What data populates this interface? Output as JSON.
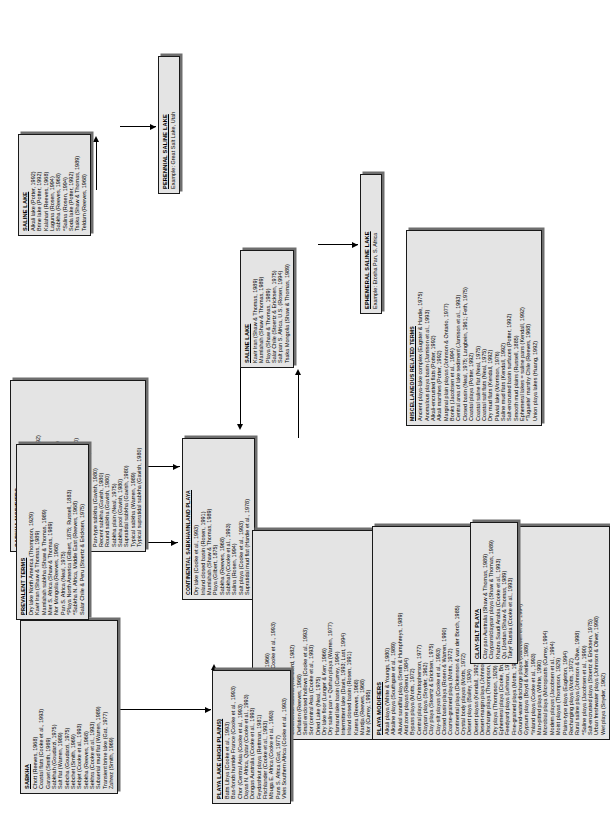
{
  "figure": {
    "type": "hierarchical classification flowchart",
    "orientation": "rotated 90 degrees (landscape figure on portrait page)"
  },
  "boxes": {
    "sabkha": {
      "title": "SABKHA",
      "items": [
        "Chott (Reeves, 1968)",
        "Coastal flats (Cooke et al., 1993)",
        "Garaet (Smith, 1969)",
        "Sabkhah (Goudarzi, 1975)",
        "Salt flat (Warren, 1989)",
        "Sebcha (Goudarzi, 1975)",
        "Sebchet (Smith, 1969)",
        "Sebjet (Cooke et al., 1993)",
        "Sebkha (Reeves, 1968)",
        "Sekhra (Cooke et al., 1993)",
        "Subaerial mud flat (Warren, 1989)",
        "Transient brine lake (Gat, 1977)",
        "Zahrez (Smith, 1969)"
      ]
    },
    "sabkha_modifiers": {
      "title": "SABKHA MODIFIERS",
      "items": [
        "Ancient sabkha (Warren, 1989)",
        "Coastal sabkha (Warren, 1989)",
        "Coastal siliciclastic sabkha (Andersson, 1992)",
        "Continental sabkha (Handford, 1982)",
        "Fossil sabkha (Wood & Wolfe, 1969)",
        "Inland sabkha (Glennie, 1970; Davis, 1993)",
        "Interdune sabkha (Warren, 1989)",
        "Internal sabkha (Cooke et al., 1982)",
        "Lagoon beach sabkha (Levy & Yizhak, 1980)",
        "Marine coastal sabkha (Warren, 1989)",
        "Modern marine sabkha (Warren, 1989)",
        "Pan-type sabkha (Gavish, 1980)",
        "Recent sabkha (Gavish, 1980)",
        "Round sabkha (Gavish, 1980)",
        "Sabkha plain (Neal, 1975)",
        "Sabkha pool (Gavish, 1980)",
        "Supratidal sabkha (Gavish, 1980)",
        "Typical sabkha (Warren, 1989)",
        "Typical supratidal sabkha (Gavish, 1980)"
      ]
    },
    "prevalent_terms": {
      "title": "PREVALENT TERMS",
      "items": [
        "Dry lake North America (Thompson, 1929)",
        "Kavir Iran (Shaw & Thomas, 1989)",
        "Mamlahah sabkha (Shaw & Thomas, 1989)",
        "Mier S. Africa (Shaw & Thomas, 1989)",
        "Nor Mongolia (Reeves, 1968)",
        "Pan S. Africa (Neal, 1975)",
        "*Playa North America (Gilbert, 1875; Russell, 1883)",
        "*Sabkha N. Africa, Middle East (Reeves, 1968)",
        "Salar Chile & Peru (Stoertz & Ericksen, 1975)"
      ]
    },
    "continental_sabkha": {
      "title": "CONTINENTAL SABKHA/INLAND PLAYA",
      "items": [
        "Dry lake (Cooke et al., 1993)",
        "Inland closed basin (Rosen, 1991)",
        "Mamlahah (Shaw & Thomas, 1989)",
        "Playa (Gilbert, 1875)",
        "Sabkha (Reeves, 1968)",
        "Sabkhah (Cooke et al., 1993)",
        "Salina (Rosen, 1994)",
        "Salt playa (Cooke et al., 1993)",
        "Supratidal mud flat (Hardie et al., 1978)"
      ]
    },
    "playa": {
      "title": "PLAYA",
      "items": [
        "Alkali lake (Ponads & Behr, 1966)",
        "Bas-fonds humide France (Cooke et al., 1993)",
        "Chott (Cooke et al., 1993)",
        "Clay flat (Thompson, 1929)",
        "Continental sabkha (Handford, 1982)",
        "Deflation (Reeves, 1968)",
        "Small enclosed hollows (Cooke et al., 1993)",
        "Sor (central Asia (Cooke et al., 1993)",
        "Dried Lake (Neal, 1975)",
        "Dry lake floor (Langer & Kerr, 1966)",
        "Dry saline pan = Qarhan playa (Warren, 1977)",
        "Hamand lake basin (Currey, 1994)",
        "Intermittent lake (Davis, 1993; Last, 1994)",
        "Inland closed basin (Rosen, 1991)",
        "Karera (Reeves, 1968)",
        "Mardja (Reeves, 1968)",
        "Nor (Currey, 1995)",
        "Pan (Reeves, 1968)",
        "Playa (Reeves, 1968)",
        "Playa flat (Motts, 1972)",
        "Playa (Reeves, 1968)",
        "Playa (Reeves, 1968)",
        "Saline mud flat (Reeves, 1968)",
        "Sabkha salt lake or playa (Rosen, 1994)",
        "Saline (Rosen, 1994)",
        "Salina (Rosen, 1994)",
        "Salt flat sabkha (Hussain, 1991)",
        "Salt pan (Kendall, 1992)",
        "Schalu (Reeves, 1968)",
        "Sebchet (Reeves, 1968)",
        "Sebka (Reeves, 1968)",
        "Sebkha (Reeves, 1968)",
        "Shallow lake (Last, 1994)",
        "Shott (Reeves, 1968)",
        "Rei (Reeves, 1968)",
        "Takyra = dry lake (Reeves, 1968)",
        "Tyr (Reeves, 1968)"
      ]
    },
    "playa_modifiers": {
      "title": "PLAYA MODIFIERS",
      "items": [
        "Alkali playa (White & Youngs, 1980)",
        "Alkaline playa (Southgate et al., 1989)",
        "Alluvial sandflat playa (Smith & Humphreys, 1989)",
        "Arid zone playas (Rienut, 1984)",
        "Bypass playa (Motts, 1972)",
        "Central playa (Christopherson, 1977)",
        "Claypan playa (Snyder, 1962)",
        "Clay playa (Stoertz & Ericksen, 1975)",
        "Clay-silt playas (Cooke et al., 1993)",
        "Closed basin playa (Rosen & Warren, 1990)",
        "Coarse-grained playa (Motts, 1972)",
        "Continental playa (Dickenson & van der Borch, 1985)",
        "Crystal body playas (Motts, 1972)",
        "Desert playa (Bailey, 1934)",
        "Desert playas (Kendall, 1992)",
        "Desert-margin playa (Johnson, 1977)",
        "Discharge playa (Thompson, 1929)",
        "Dry playa (Thompson, 1929)",
        "Ephemeral playa (Cooke, Brunsden & Last, 1989)",
        "Feedyard playa (Lehman, 1972)",
        "Fine-grained playa (Motts, 1972)",
        "Ground-water discharge playa (Jacobsen et al., 1994)",
        "Gypsum playa (Boyd & Kreitler, 1989)",
        "*Inland playa (Cooke et al., 1993)",
        "Man-pitted playa (White, 1990)",
        "Microbial playa (Micropiasts (Currey, 1994)",
        "Modern playas (Jacobsen et al., 1994)",
        "Moist playas (Thompson, 1929)",
        "Plains-type playa (Eagleton, 1994)",
        "Recharging playa (Motts, 1972)",
        "Rural saline playa (Johnson & Olive, 1998)",
        "*Saline playa (Jacobsen et al., 1990)",
        "Salt-encrusted playa (Stoertz & Ericksen, 1975)",
        "Urban freshwater playa (Johnson & Oliver, 1998)",
        "Wet playa (Snyder, 1962)"
      ]
    },
    "playa_lake": {
      "title": "PLAYA LAKE (HIGH PLAINS)",
      "items": [
        "Batts Libya (Cooke et al., 1993)",
        "Bas-fonds humide France (Cooke et al., 1993)",
        "Chor (Central Asia (Cooke et al., 1993)",
        "Dayas N. Africa, Qatar (Cooke et al., 1993)",
        "Dongas Australia (Cooke et al., 1993)",
        "Feydashkut playa (Rettman, 1981)",
        "Fischlander (Cooke et al., 1993)",
        "Mbuga E. Africa (Cooke et al., 1993)",
        "Pans S. Africa (Gat, 1977)",
        "Vleis Southern Africa (Cooke et al., 1993)"
      ]
    },
    "clay_silt_playa": {
      "title": "CLAY-SILT PLAYA",
      "items": [
        "Clay pan Australia (Shaw & Thomas, 1989)",
        "Claypans/claypan playa (Shaw & Thomas, 1989)",
        "Khabra Saudi Arabia (Cooke et al., 1993)",
        "Qa (Jordan (Shaw & Thomas, 1989)",
        "Takyr Russia (Cooke et al., 1993)"
      ]
    },
    "miscellaneous": {
      "title": "MISCELLANEOUS RELATED TERMS",
      "items": [
        "Ancient playa-lake complex (Eugster & Hardie, 1975)",
        "Anomalous playa basin (Jamison et al., 1993)",
        "Alkali-encrusted flats (Potter, 1992)",
        "Alkali marshes (Potter, 1992)",
        "Marginal plain playas (Johnson & Ontario, 1977)",
        "Bonks (Jacobsen et al., 1994)",
        "Central area of lake sediment (Jamison et al., 1993)",
        "Closed basin (Neal, 1975; Langbein, 1961; Feth, 1975)",
        "Coastal playa (Potter, 1992)",
        "Coastal saline flat (Neal, 1975)",
        "Coastal salt flats (Neal, 1975)",
        "Dry mud flats (Kendall, 1992)",
        "Pluvial lake (Morrison, 1976)",
        "Saline mud flats (Kendall, 1992)",
        "Salt-encrusted basin surfaces (Potter, 1992)",
        "Smooth mud plains (Russell, 1885)",
        "Ephemeral lakes = saline pans (Kendall, 1992)",
        "*Tugaeite' marshy Chile (Reeves, 1968)",
        "Union playa lakes (Huang, 1992)"
      ]
    },
    "saline_lake": {
      "title": "SALINE LAKE",
      "items": [
        "Kavir Iran (Shaw & Thomas, 1989)",
        "Mamlahah (Shaw & Thomas, 1989)",
        "Playa (Shaw & Thomas, 1989)",
        "Salar Chile (Stoertz & Ericksen, 1975)",
        "Salt pan S. Africa, U.S. (Rosen, 1994)",
        "Tsaka Mongolia (Shaw & Thomas, 1989)"
      ]
    },
    "saline_lake2": {
      "title": "SALINE LAKE",
      "items": [
        "Alkali lake (Potter, 1992)",
        "Brine lake (Potter, 1992)",
        "Kalahari (Reeves, 1968)",
        "Laguna (Rosen, 1994)",
        "Sabkha (Reeves, 1968)",
        "*Salina (Rosen, 1994)",
        "Soda lake (Potter, 1992)",
        "Tsaka (Shaw & Thomas, 1989)",
        "Teldam (Reeves, 1968)"
      ]
    },
    "ephemeral_saline_lake": {
      "title": "EPHEMERAL SALINE LAKE",
      "note": "Example: Etosha Pan, S. Africa"
    },
    "perennial_saline_lake": {
      "title": "PERENNIAL SALINE LAKE",
      "note": "Example: Great Salt Lake, Utah"
    }
  }
}
